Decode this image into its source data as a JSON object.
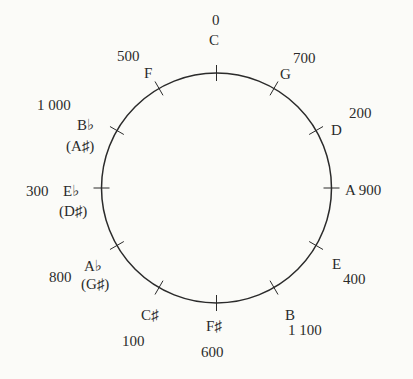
{
  "diagram": {
    "type": "pitch-class circle",
    "colors": {
      "background": "#fbfbf8",
      "stroke": "#2b2b2b",
      "text": "#2b2b2b"
    },
    "circle": {
      "cx": 216.5,
      "cy": 188,
      "r": 115
    },
    "notes": [
      {
        "name": "C",
        "alt": "",
        "value": "0"
      },
      {
        "name": "G",
        "alt": "",
        "value": "700"
      },
      {
        "name": "D",
        "alt": "",
        "value": "200"
      },
      {
        "name": "A",
        "alt": "",
        "value": "900"
      },
      {
        "name": "E",
        "alt": "",
        "value": "400"
      },
      {
        "name": "B",
        "alt": "",
        "value": "1 100"
      },
      {
        "name": "F♯",
        "alt": "",
        "value": "600"
      },
      {
        "name": "C♯",
        "alt": "",
        "value": "100"
      },
      {
        "name": "A♭",
        "alt": "(G♯)",
        "value": "800"
      },
      {
        "name": "E♭",
        "alt": "(D♯)",
        "value": "300"
      },
      {
        "name": "B♭",
        "alt": "(A♯)",
        "value": "1 000"
      },
      {
        "name": "F",
        "alt": "",
        "value": "500"
      }
    ]
  }
}
